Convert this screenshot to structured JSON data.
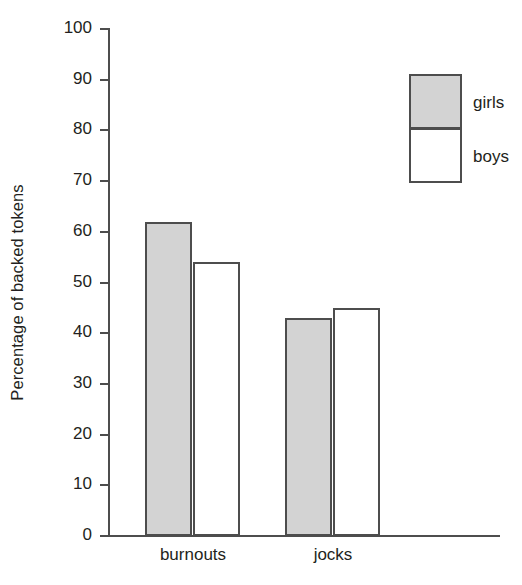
{
  "chart_data": {
    "type": "bar",
    "title": "",
    "xlabel": "",
    "ylabel": "Percentage of backed tokens",
    "categories": [
      "burnouts",
      "jocks"
    ],
    "series": [
      {
        "name": "girls",
        "values": [
          62,
          43
        ],
        "color": "#d3d3d3"
      },
      {
        "name": "boys",
        "values": [
          54,
          45
        ],
        "color": "#ffffff"
      }
    ],
    "ylim": [
      0,
      100
    ],
    "ytick_labels": [
      "100",
      "90",
      "80",
      "70",
      "60",
      "50",
      "40",
      "30",
      "20",
      "10",
      "0"
    ],
    "ytick_values": [
      100,
      90,
      80,
      70,
      60,
      50,
      40,
      30,
      20,
      10,
      0
    ],
    "grid": false,
    "legend_position": "top-right",
    "legend_entries": [
      "girls",
      "boys"
    ]
  },
  "axes": {
    "y_title": "Percentage of backed tokens"
  },
  "legend": {
    "girls_label": "girls",
    "boys_label": "boys"
  },
  "categories": {
    "burnouts": "burnouts",
    "jocks": "jocks"
  }
}
